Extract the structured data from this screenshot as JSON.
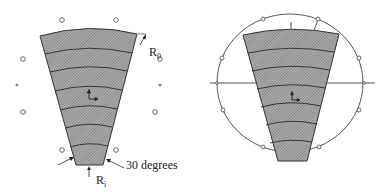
{
  "diagram": {
    "left_panel": {
      "labels": {
        "outer_radius": "R",
        "outer_radius_sub": "0",
        "inner_radius": "R",
        "inner_radius_sub": "i",
        "angle": "30 degrees"
      },
      "band_count": 7
    },
    "right_panel": {
      "band_count": 7
    },
    "colors": {
      "fill": "#9a9a9a",
      "stroke": "#333333",
      "hatch": "#5a5a5a"
    }
  }
}
